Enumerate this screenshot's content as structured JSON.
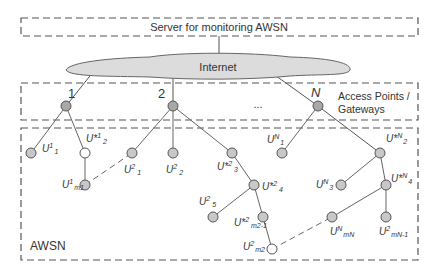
{
  "server": {
    "label": "Server for monitoring AWSN"
  },
  "internet": {
    "label": "Internet"
  },
  "access_points": {
    "label_line1": "Access Points /",
    "label_line2": "Gateways",
    "gateways": [
      {
        "id": "1",
        "label": "1"
      },
      {
        "id": "2",
        "label": "2"
      },
      {
        "id": "N",
        "label": "N"
      }
    ],
    "ellipsis": "..."
  },
  "awsn": {
    "label": "AWSN"
  },
  "nodes": {
    "U1_1": {
      "base": "U",
      "sup": "1",
      "sub": "1"
    },
    "Ustar1_2": {
      "base": "U*",
      "sup": "1",
      "sub": "2"
    },
    "U1_m1": {
      "base": "U",
      "sup": "1",
      "sub": "m1"
    },
    "U2_1": {
      "base": "U",
      "sup": "2",
      "sub": "1"
    },
    "U2_2": {
      "base": "U",
      "sup": "2",
      "sub": "2"
    },
    "Ustar2_3": {
      "base": "U*",
      "sup": "2",
      "sub": "3"
    },
    "Ustar2_4": {
      "base": "U*",
      "sup": "2",
      "sub": "4"
    },
    "U2_5": {
      "base": "U",
      "sup": "2",
      "sub": "5"
    },
    "Ustar2_m21": {
      "base": "U*",
      "sup": "2",
      "sub": "m2-1"
    },
    "U2_m2": {
      "base": "U",
      "sup": "2",
      "sub": "m2"
    },
    "UN_1": {
      "base": "U",
      "sup": "N",
      "sub": "1"
    },
    "UstarN_2": {
      "base": "U*",
      "sup": "N",
      "sub": "2"
    },
    "UN_3": {
      "base": "U",
      "sup": "N",
      "sub": "3"
    },
    "UstarN_4": {
      "base": "U*",
      "sup": "N",
      "sub": "4"
    },
    "UN_mN": {
      "base": "U",
      "sup": "N",
      "sub": "mN"
    },
    "U2_mN1": {
      "base": "U",
      "sup": "2",
      "sub": "mN-1"
    }
  },
  "colors": {
    "node_fill": "#c8c8c8",
    "node_open_fill": "#ffffff",
    "stroke": "#555555",
    "cloud_fill": "#dcdcdc",
    "dash": "#555555"
  }
}
